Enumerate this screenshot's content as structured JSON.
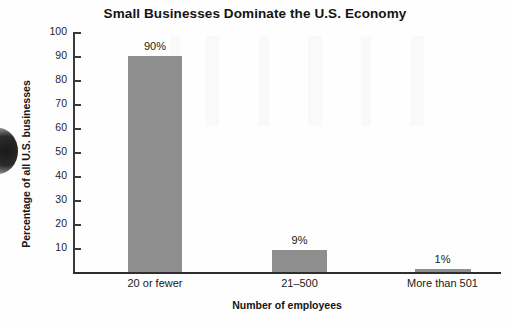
{
  "chart_data": {
    "type": "bar",
    "title": "Small Businesses Dominate the U.S. Economy",
    "xlabel": "Number of employees",
    "ylabel": "Percentage of all U.S. businesses",
    "categories": [
      "20 or fewer",
      "21–500",
      "More than 501"
    ],
    "values": [
      90,
      9,
      1
    ],
    "value_labels": [
      "90%",
      "9%",
      "1%"
    ],
    "ylim": [
      0,
      100
    ],
    "yticks": [
      100,
      90,
      80,
      70,
      60,
      50,
      40,
      30,
      20,
      10
    ],
    "ytick_labels": [
      "100",
      "90",
      "80",
      "70",
      "60",
      "50",
      "40",
      "30",
      "20",
      "10"
    ],
    "grid": false,
    "legend": false,
    "bar_color": "#8f8f8f",
    "axis_color": "#2e2e2e",
    "background_color": "#fefefe"
  }
}
